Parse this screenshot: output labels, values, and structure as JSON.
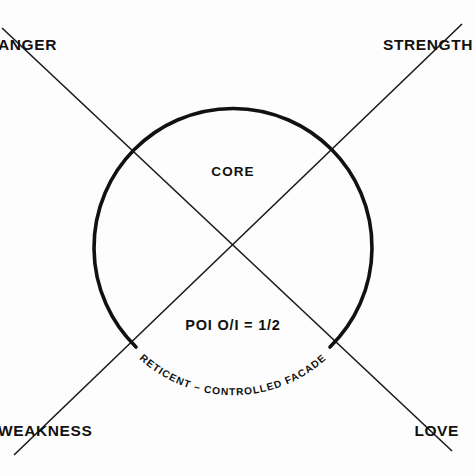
{
  "diagram": {
    "title_text": "CORE",
    "formula_text": "POI O/I  =  1/2",
    "arc_caption": "RETICENT – CONTROLLED FACADE",
    "quadrant_labels": {
      "top_left": "ANGER",
      "top_right": "STRENGTH",
      "bottom_left": "WEAKNESS",
      "bottom_right": "LOVE"
    },
    "colors": {
      "background": "#fdfdfd",
      "ink": "#111111",
      "line": "#1a1a1a"
    },
    "geometry": {
      "circle_center_x": 233,
      "circle_center_y": 238,
      "circle_radius": 139,
      "arc_gap_note": "open at bottom where caption runs",
      "intersection_x": 233,
      "intersection_y": 238
    }
  }
}
